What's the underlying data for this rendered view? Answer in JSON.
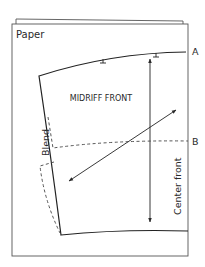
{
  "diagram": {
    "paper_label": "Paper",
    "pattern_title": "MIDRIFF FRONT",
    "points": {
      "a": "A",
      "b": "B"
    },
    "side_labels": {
      "blend": "Blend",
      "center_front": "Center front"
    },
    "elements": [
      {
        "type": "sheet",
        "name": "back-paper-sheet"
      },
      {
        "type": "sheet",
        "name": "front-paper-sheet"
      },
      {
        "type": "pattern-outline",
        "name": "midriff-front-pattern"
      },
      {
        "type": "notch",
        "count": 2
      },
      {
        "type": "arrow",
        "name": "center-front-grainline",
        "direction": "double-ended vertical"
      },
      {
        "type": "arrow",
        "name": "bias-grainline",
        "direction": "double-ended diagonal"
      },
      {
        "type": "dashed-line",
        "name": "line-to-b"
      },
      {
        "type": "dashed-line",
        "name": "blend-extension"
      }
    ],
    "colors": {
      "line": "#2a2a2a",
      "paper_edge": "#555555",
      "background": "#ffffff"
    }
  }
}
